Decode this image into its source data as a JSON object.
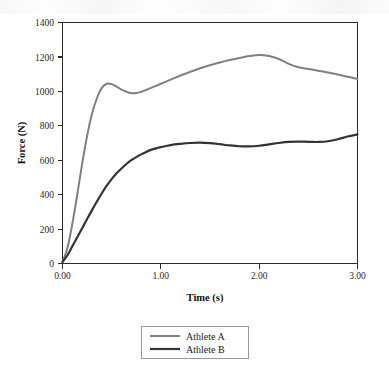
{
  "figure": {
    "background_color": "#ffffff",
    "plot_frame_color": "#2b2b2b"
  },
  "chart_data": {
    "type": "line",
    "title": "",
    "xlabel": "Time (s)",
    "ylabel": "Force (N)",
    "xlim": [
      0.0,
      3.0
    ],
    "ylim": [
      0,
      1400
    ],
    "xticks": [
      0.0,
      1.0,
      2.0,
      3.0
    ],
    "xtick_labels": [
      "0.00",
      "1.00",
      "2.00",
      "3.00"
    ],
    "yticks": [
      0,
      200,
      400,
      600,
      800,
      1000,
      1200,
      1400
    ],
    "ytick_labels": [
      "0",
      "200",
      "400",
      "600",
      "800",
      "1000",
      "1200",
      "1400"
    ],
    "grid": false,
    "legend_position": "below-center",
    "x": [
      0.0,
      0.05,
      0.1,
      0.15,
      0.2,
      0.25,
      0.3,
      0.35,
      0.4,
      0.45,
      0.5,
      0.55,
      0.6,
      0.65,
      0.7,
      0.75,
      0.8,
      0.85,
      0.9,
      0.95,
      1.0,
      1.1,
      1.2,
      1.3,
      1.4,
      1.5,
      1.6,
      1.7,
      1.8,
      1.9,
      2.0,
      2.1,
      2.2,
      2.3,
      2.4,
      2.5,
      2.6,
      2.7,
      2.8,
      2.9,
      3.0
    ],
    "series": [
      {
        "name": "Athlete A",
        "color": "#808080",
        "line_width": 2.0,
        "values": [
          10,
          90,
          230,
          400,
          580,
          740,
          870,
          960,
          1020,
          1044,
          1042,
          1028,
          1010,
          998,
          990,
          990,
          997,
          1008,
          1020,
          1032,
          1044,
          1068,
          1092,
          1114,
          1134,
          1152,
          1168,
          1182,
          1194,
          1205,
          1211,
          1205,
          1188,
          1160,
          1140,
          1130,
          1120,
          1110,
          1098,
          1085,
          1072
        ]
      },
      {
        "name": "Athlete B",
        "color": "#333333",
        "line_width": 2.2,
        "values": [
          8,
          48,
          100,
          152,
          205,
          258,
          310,
          360,
          408,
          452,
          490,
          524,
          552,
          578,
          600,
          618,
          634,
          648,
          660,
          669,
          676,
          688,
          695,
          700,
          702,
          699,
          693,
          686,
          681,
          680,
          684,
          692,
          700,
          706,
          708,
          707,
          706,
          710,
          722,
          738,
          750
        ]
      }
    ],
    "legend_entries": [
      {
        "label": "Athlete A",
        "color": "#808080",
        "line_width": 2.0
      },
      {
        "label": "Athlete B",
        "color": "#333333",
        "line_width": 2.2
      }
    ]
  }
}
